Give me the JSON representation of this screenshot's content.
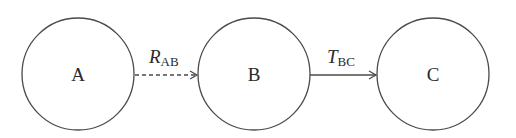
{
  "diagram": {
    "type": "state-transition",
    "colors": {
      "stroke": "#4a4a4a",
      "text": "#2a2a2a",
      "background": "#ffffff"
    },
    "nodes": [
      {
        "id": "A",
        "label": "A",
        "cx": 78,
        "cy": 74,
        "r": 56
      },
      {
        "id": "B",
        "label": "B",
        "cx": 254,
        "cy": 74,
        "r": 56
      },
      {
        "id": "C",
        "label": "C",
        "cx": 433,
        "cy": 74,
        "r": 56
      }
    ],
    "edges": [
      {
        "from": "A",
        "to": "B",
        "main": "R",
        "sub": "AB",
        "style": "dashed"
      },
      {
        "from": "B",
        "to": "C",
        "main": "T",
        "sub": "BC",
        "style": "solid"
      }
    ]
  }
}
